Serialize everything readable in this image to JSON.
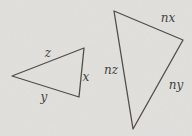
{
  "figure": {
    "colors": {
      "paper": "#e2e1de",
      "ink": "#514e49"
    },
    "small_triangle": {
      "points": "12,76 84,48 79,97",
      "labels": {
        "top": {
          "text": "z"
        },
        "right": {
          "text": "x"
        },
        "bottom": {
          "text": "y"
        }
      }
    },
    "large_triangle": {
      "points": "114,11 183,40 133,129",
      "labels": {
        "top": {
          "text": "nx"
        },
        "left": {
          "text": "nz"
        },
        "right": {
          "text": "ny"
        }
      }
    }
  }
}
